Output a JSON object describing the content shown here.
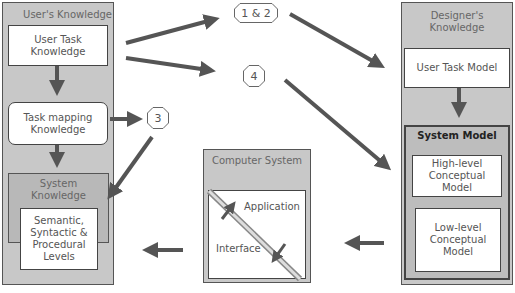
{
  "user_knowledge": {
    "title": "User's Knowledge",
    "user_task": "User Task\nKnowledge",
    "task_mapping": "Task mapping\nKnowledge",
    "system_knowledge": "System\nKnowledge",
    "levels": "Semantic,\nSyntactic &\nProcedural\nLevels"
  },
  "designer_knowledge": {
    "title": "Designer's\nKnowledge",
    "user_task_model": "User Task Model",
    "system_model": "System Model",
    "high_level": "High-level\nConceptual\nModel",
    "low_level": "Low-level\nConceptual\nModel"
  },
  "computer_system": {
    "title": "Computer System",
    "application": "Application",
    "interface": "Interface"
  },
  "labels": {
    "one_two": "1 & 2",
    "four": "4",
    "three": "3"
  },
  "colors": {
    "panel": "#c8c8c8",
    "arrow": "#555555"
  }
}
